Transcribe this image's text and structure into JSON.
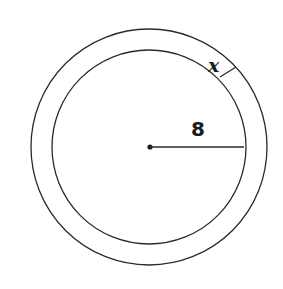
{
  "figure": {
    "type": "concentric-circles",
    "inner_radius_label": "8",
    "ring_width_label": "x",
    "colors": {
      "stroke": "#2a2a2a",
      "background": "#ffffff"
    }
  }
}
